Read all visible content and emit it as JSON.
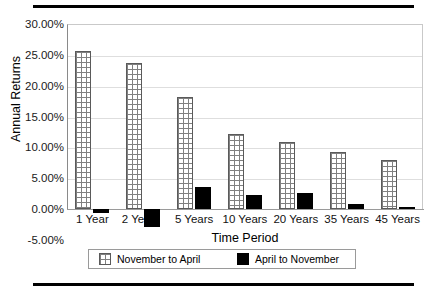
{
  "chart_data": {
    "type": "bar",
    "title": "",
    "xlabel": "Time Period",
    "ylabel": "Annual Returns",
    "categories": [
      "1 Year",
      "2 Years",
      "5 Years",
      "10 Years",
      "20 Years",
      "35 Years",
      "45 Years"
    ],
    "series": [
      {
        "name": "November to April",
        "values": [
          25.6,
          23.7,
          18.2,
          12.1,
          10.8,
          9.3,
          8.0
        ],
        "fill": "cross-hatch-white"
      },
      {
        "name": "April to November",
        "values": [
          -0.7,
          -2.9,
          3.6,
          2.2,
          2.6,
          0.8,
          0.2
        ],
        "fill": "solid-black"
      }
    ],
    "ylim": [
      -5,
      30
    ],
    "ytick_step": 5,
    "ytick_labels": [
      "30.00%",
      "25.00%",
      "20.00%",
      "15.00%",
      "10.00%",
      "5.00%",
      "0.00%",
      "-5.00%"
    ],
    "ytick_values": [
      30,
      25,
      20,
      15,
      10,
      5,
      0,
      -5
    ],
    "grid": true,
    "legend_position": "bottom",
    "legend_entries": [
      "November to April",
      "April to November"
    ],
    "occluded_labels": {
      "2 Years": "2 Ye"
    }
  },
  "colors": {
    "bar_black": "#000000",
    "bar_white_fill": "#ffffff",
    "bar_white_hatch": "#808080",
    "gridline": "#dedede",
    "axis": "#8a8a8a",
    "rule": "#000000",
    "text": "#111111"
  }
}
